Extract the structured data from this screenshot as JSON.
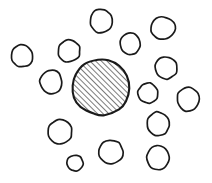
{
  "figure": {
    "kind": "hand-drawn-diagram",
    "canvas": {
      "width": 212,
      "height": 183,
      "background": "#ffffff"
    },
    "ink_color": "#1a1a1a",
    "fill_color": "#ffffff",
    "central_shape": {
      "name": "central-hatched-circle",
      "cx": 101,
      "cy": 87,
      "rx": 29,
      "ry": 28,
      "fill_pattern": "diagonal-hatch",
      "hatch_angle_degrees": 45,
      "hatch_spacing": 4,
      "stroke_width": 2.1
    },
    "surrounding_shapes": [
      {
        "name": "circle-top",
        "cx": 101,
        "cy": 21,
        "rx": 11,
        "ry": 12
      },
      {
        "name": "circle-top-right",
        "cx": 163,
        "cy": 28,
        "rx": 12,
        "ry": 11
      },
      {
        "name": "circle-upper-right",
        "cx": 130,
        "cy": 44,
        "rx": 10,
        "ry": 11
      },
      {
        "name": "circle-upper-left",
        "cx": 69,
        "cy": 51,
        "rx": 11,
        "ry": 11
      },
      {
        "name": "circle-left",
        "cx": 22,
        "cy": 56,
        "rx": 11,
        "ry": 11
      },
      {
        "name": "circle-right",
        "cx": 166,
        "cy": 68,
        "rx": 11,
        "ry": 11
      },
      {
        "name": "circle-mid-left",
        "cx": 51,
        "cy": 82,
        "rx": 11,
        "ry": 12
      },
      {
        "name": "circle-mid-right",
        "cx": 148,
        "cy": 93,
        "rx": 10,
        "ry": 10
      },
      {
        "name": "circle-far-right",
        "cx": 188,
        "cy": 99,
        "rx": 11,
        "ry": 12
      },
      {
        "name": "circle-lower-right",
        "cx": 158,
        "cy": 124,
        "rx": 11,
        "ry": 12
      },
      {
        "name": "circle-lower-left",
        "cx": 60,
        "cy": 132,
        "rx": 12,
        "ry": 12
      },
      {
        "name": "circle-bottom-center",
        "cx": 111,
        "cy": 152,
        "rx": 12,
        "ry": 12
      },
      {
        "name": "circle-bottom-right",
        "cx": 158,
        "cy": 158,
        "rx": 11,
        "ry": 12
      },
      {
        "name": "circle-bottom-small",
        "cx": 75,
        "cy": 163,
        "rx": 8,
        "ry": 8
      }
    ],
    "counts": {
      "central_shapes": 1,
      "surrounding_shapes": 14,
      "total_shapes": 15
    }
  }
}
